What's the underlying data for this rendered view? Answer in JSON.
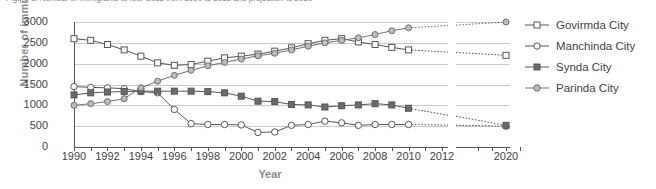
{
  "title_clipped": "Figure 1: Number of immigrants to four cities from 1990 to 2012 and projection to 2020",
  "axes": {
    "ylabel": "Number of immigrants",
    "xlabel": "Year",
    "yticks": [
      "0",
      "500",
      "1000",
      "1500",
      "2000",
      "2500",
      "3000"
    ],
    "xticks": [
      "1990",
      "1992",
      "1994",
      "1996",
      "1998",
      "2000",
      "2002",
      "2004",
      "2006",
      "2008",
      "2010",
      "2012",
      "2020"
    ]
  },
  "legend": {
    "items": [
      {
        "label": "Govirmda City",
        "marker": "open-square",
        "color": "#555555"
      },
      {
        "label": "Manchinda City",
        "marker": "open-circle",
        "color": "#555555"
      },
      {
        "label": "Synda City",
        "marker": "filled-square",
        "color": "#555555"
      },
      {
        "label": "Parinda City",
        "marker": "small-circle",
        "color": "#6e6e6e"
      }
    ]
  },
  "chart_data": {
    "type": "line",
    "title": "Number of immigrants to four cities from 1990 to 2012 and projection to 2020",
    "xlabel": "Year",
    "ylabel": "Number of immigrants",
    "ylim": [
      0,
      3000
    ],
    "ytick_step": 500,
    "grid": true,
    "legend_position": "right",
    "axis_break": {
      "between": [
        2012,
        2020
      ],
      "note": "x-axis broken between 2012 and 2020"
    },
    "projection_starts": 2010,
    "x": [
      1990,
      1991,
      1992,
      1993,
      1994,
      1995,
      1996,
      1997,
      1998,
      1999,
      2000,
      2001,
      2002,
      2003,
      2004,
      2005,
      2006,
      2007,
      2008,
      2009,
      2010,
      2020
    ],
    "series": [
      {
        "name": "Govirmda City",
        "values": [
          2600,
          2560,
          2460,
          2330,
          2180,
          2020,
          1960,
          1980,
          2060,
          2140,
          2180,
          2230,
          2300,
          2380,
          2480,
          2560,
          2600,
          2520,
          2460,
          2390,
          2330,
          2200
        ],
        "projected_from": 2010
      },
      {
        "name": "Manchinda City",
        "values": [
          1450,
          1430,
          1420,
          1400,
          1330,
          1300,
          900,
          560,
          540,
          540,
          530,
          350,
          360,
          520,
          540,
          620,
          580,
          520,
          540,
          540,
          540,
          500
        ],
        "projected_from": 2010
      },
      {
        "name": "Synda City",
        "values": [
          1250,
          1300,
          1320,
          1330,
          1340,
          1340,
          1340,
          1340,
          1330,
          1300,
          1220,
          1100,
          1090,
          1020,
          1010,
          960,
          990,
          1010,
          1040,
          1010,
          930,
          520
        ],
        "projected_from": 2010
      },
      {
        "name": "Parinda City",
        "values": [
          1000,
          1040,
          1090,
          1160,
          1420,
          1580,
          1720,
          1840,
          1950,
          2030,
          2110,
          2190,
          2250,
          2330,
          2420,
          2500,
          2560,
          2620,
          2700,
          2790,
          2860,
          3000
        ],
        "projected_from": 2010
      }
    ]
  }
}
